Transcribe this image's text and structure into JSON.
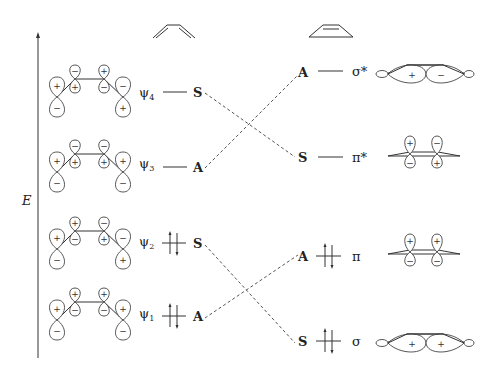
{
  "axis": {
    "label": "E",
    "direction": "up"
  },
  "columns": {
    "left": {
      "molecule": "butadiene (s-cis)",
      "icon": "butadiene-icon"
    },
    "right": {
      "molecule": "cyclobutene",
      "icon": "cyclobutene-icon"
    }
  },
  "butadiene_orbitals": [
    {
      "name": "ψ4",
      "sub": "4",
      "symmetry": "S",
      "occupied": false,
      "lobes_top": [
        "+",
        "−",
        "+",
        "−"
      ],
      "lobes_bottom": [
        "−",
        "+",
        "−",
        "+"
      ]
    },
    {
      "name": "ψ3",
      "sub": "3",
      "symmetry": "A",
      "occupied": false,
      "lobes_top": [
        "+",
        "−",
        "−",
        "+"
      ],
      "lobes_bottom": [
        "−",
        "+",
        "+",
        "−"
      ]
    },
    {
      "name": "ψ2",
      "sub": "2",
      "symmetry": "S",
      "occupied": true,
      "lobes_top": [
        "+",
        "+",
        "−",
        "−"
      ],
      "lobes_bottom": [
        "−",
        "−",
        "+",
        "+"
      ]
    },
    {
      "name": "ψ1",
      "sub": "1",
      "symmetry": "A",
      "occupied": true,
      "lobes_top": [
        "+",
        "+",
        "+",
        "+"
      ],
      "lobes_bottom": [
        "−",
        "−",
        "−",
        "−"
      ]
    }
  ],
  "cyclobutene_orbitals": [
    {
      "name": "σ*",
      "symmetry": "A",
      "occupied": false,
      "lobes": [
        "+",
        "−"
      ]
    },
    {
      "name": "π*",
      "symmetry": "S",
      "occupied": false,
      "lobes_top": [
        "+",
        "−"
      ],
      "lobes_bottom": [
        "−",
        "+"
      ]
    },
    {
      "name": "π",
      "symmetry": "A",
      "occupied": true,
      "lobes_top": [
        "+",
        "+"
      ],
      "lobes_bottom": [
        "−",
        "−"
      ]
    },
    {
      "name": "σ",
      "symmetry": "S",
      "occupied": true,
      "lobes": [
        "+",
        "+"
      ]
    }
  ],
  "correlations": [
    {
      "from": "ψ4 (S)",
      "to": "π* (S)"
    },
    {
      "from": "ψ3 (A)",
      "to": "σ* (A)"
    },
    {
      "from": "ψ2 (S)",
      "to": "σ (S)"
    },
    {
      "from": "ψ1 (A)",
      "to": "π (A)"
    }
  ],
  "labels": {
    "E": "E",
    "psi": "ψ",
    "sigma_star": "σ*",
    "pi_star": "π*",
    "pi": "π",
    "sigma": "σ",
    "S": "S",
    "A": "A"
  }
}
